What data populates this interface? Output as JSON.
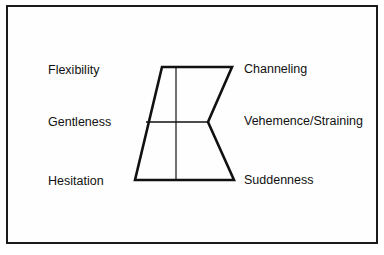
{
  "diagram": {
    "left_labels": [
      "Flexibility",
      "Gentleness",
      "Hesitation"
    ],
    "right_labels": [
      "Channeling",
      "Vehemence/Straining",
      "Suddenness"
    ],
    "colors": {
      "line": "#111111",
      "background": "#ffffff",
      "frame": "#1a1a1a"
    },
    "shape": {
      "outline_points": [
        [
          162,
          67
        ],
        [
          232,
          67
        ],
        [
          208,
          122
        ],
        [
          234,
          180
        ],
        [
          135,
          180
        ]
      ],
      "horizontal_divider": [
        [
          146,
          122
        ],
        [
          208,
          122
        ]
      ],
      "vertical_divider": [
        [
          176,
          67
        ],
        [
          176,
          180
        ]
      ]
    }
  }
}
